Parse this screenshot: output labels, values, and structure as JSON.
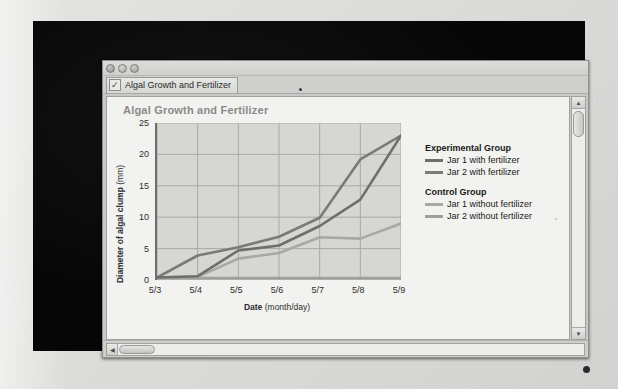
{
  "window": {
    "buttons": [
      "close",
      "minimize",
      "maximize"
    ],
    "tab_label": "Algal Growth and Fertilizer",
    "tab_icon": "checkmark-icon",
    "check_glyph": "✓"
  },
  "scrollbars": {
    "up_glyph": "▲",
    "down_glyph": "▼",
    "left_glyph": "◀"
  },
  "chart_data": {
    "type": "line",
    "title": "Algal Growth and Fertilizer",
    "xlabel": "Date",
    "xlabel_unit": "(month/day)",
    "ylabel": "Diameter of algal clump",
    "ylabel_unit": "(mm)",
    "categories": [
      "5/3",
      "5/4",
      "5/5",
      "5/6",
      "5/7",
      "5/8",
      "5/9"
    ],
    "ylim": [
      0,
      25
    ],
    "yticks": [
      0,
      5,
      10,
      15,
      20,
      25
    ],
    "grid": true,
    "legend_position": "right",
    "series": [
      {
        "name": "Jar 1 with fertilizer",
        "group": "Experimental Group",
        "color": "#6e6e6c",
        "values": [
          0.4,
          0.6,
          4.7,
          5.5,
          8.6,
          12.8,
          23.0
        ]
      },
      {
        "name": "Jar 2 with fertilizer",
        "group": "Experimental Group",
        "color": "#7a7a78",
        "values": [
          0.4,
          3.9,
          5.2,
          6.9,
          9.9,
          19.2,
          23.0
        ]
      },
      {
        "name": "Jar 1 without fertilizer",
        "group": "Control Group",
        "color": "#a8a8a6",
        "values": [
          0.4,
          0.5,
          3.4,
          4.3,
          6.8,
          6.6,
          9.0
        ]
      },
      {
        "name": "Jar 2 without fertilizer",
        "group": "Control Group",
        "color": "#9e9e9c",
        "values": [
          0.3,
          0.3,
          0.3,
          0.3,
          0.3,
          0.3,
          0.3
        ]
      }
    ],
    "legend": [
      {
        "heading": "Experimental Group",
        "items": [
          {
            "label": "Jar 1 with fertilizer",
            "color": "#6e6e6c"
          },
          {
            "label": "Jar 2 with fertilizer",
            "color": "#7a7a78"
          }
        ]
      },
      {
        "heading": "Control Group",
        "items": [
          {
            "label": "Jar 1 without fertilizer",
            "color": "#a8a8a6"
          },
          {
            "label": "Jar 2 without fertilizer",
            "color": "#9e9e9c"
          }
        ]
      }
    ]
  }
}
